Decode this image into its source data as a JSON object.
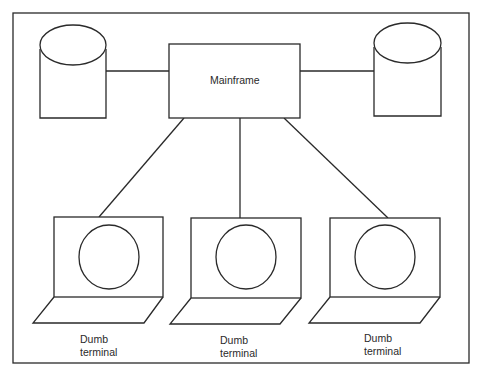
{
  "diagram": {
    "type": "network-topology",
    "central_node": {
      "label": "Mainframe"
    },
    "storage_nodes": [
      {
        "id": "disk-left",
        "shape": "cylinder"
      },
      {
        "id": "disk-right",
        "shape": "cylinder"
      }
    ],
    "terminals": [
      {
        "line1": "Dumb",
        "line2": "terminal"
      },
      {
        "line1": "Dumb",
        "line2": "terminal"
      },
      {
        "line1": "Dumb",
        "line2": "terminal"
      }
    ],
    "edges": [
      {
        "from": "disk-left",
        "to": "Mainframe"
      },
      {
        "from": "Mainframe",
        "to": "disk-right"
      },
      {
        "from": "Mainframe",
        "to": "terminal-1"
      },
      {
        "from": "Mainframe",
        "to": "terminal-2"
      },
      {
        "from": "Mainframe",
        "to": "terminal-3"
      }
    ],
    "colors": {
      "line": "#2a2a2a",
      "background": "#ffffff"
    }
  }
}
